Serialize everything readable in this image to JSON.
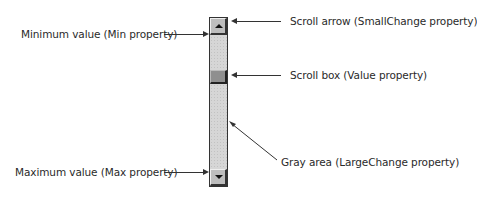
{
  "diagram": {
    "type": "vertical-scrollbar-anatomy",
    "scrollbar": {
      "up_arrow_icon": "triangle-up",
      "down_arrow_icon": "triangle-down",
      "thumb_color": "#8f8f8f",
      "track_color": "#d6d6d6"
    },
    "callouts": {
      "min_value": "Minimum value (Min property)",
      "max_value": "Maximum value (Max property)",
      "scroll_arrow": "Scroll arrow (SmallChange property)",
      "scroll_box": "Scroll box (Value property)",
      "gray_area": "Gray area (LargeChange property)"
    }
  }
}
